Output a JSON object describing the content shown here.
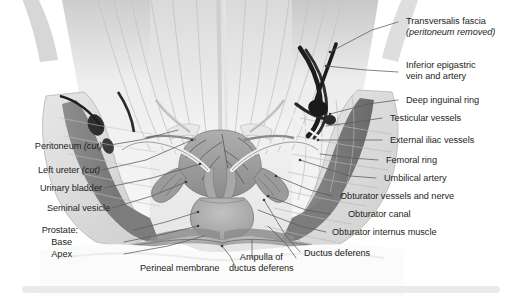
{
  "figure": {
    "style": "grayscale medical illustration"
  },
  "colors": {
    "label_text": "#231f20",
    "leader_line": "#58595b",
    "background": "#ffffff",
    "bottom_band": "#e9eaeb",
    "bone_light": "#dcdcdc",
    "muscle_mid": "#9a9a9a",
    "muscle_dark": "#6e6e6e",
    "vessel_dark": "#2b2b2b",
    "organ_mid": "#b5b5b5",
    "fascia_pale": "#efefef"
  },
  "labels": {
    "right": [
      {
        "id": "transversalis-fascia",
        "line1": "Transversalis fascia",
        "line2": "(peritoneum removed)",
        "line2_italic": true
      },
      {
        "id": "inferior-epigastric",
        "line1": "Inferior epigastric",
        "line2": "vein and artery",
        "line2_italic": false
      },
      {
        "id": "deep-inguinal-ring",
        "line1": "Deep inguinal ring",
        "line2": "",
        "line2_italic": false
      },
      {
        "id": "testicular-vessels",
        "line1": "Testicular vessels",
        "line2": "",
        "line2_italic": false
      },
      {
        "id": "external-iliac-vessels",
        "line1": "External iliac vessels",
        "line2": "",
        "line2_italic": false
      },
      {
        "id": "femoral-ring",
        "line1": "Femoral ring",
        "line2": "",
        "line2_italic": false
      },
      {
        "id": "umbilical-artery",
        "line1": "Umbilical artery",
        "line2": "",
        "line2_italic": false
      },
      {
        "id": "obturator-vessels-nerve",
        "line1": "Obturator vessels and nerve",
        "line2": "",
        "line2_italic": false
      },
      {
        "id": "obturator-canal",
        "line1": "Obturator canal",
        "line2": "",
        "line2_italic": false
      },
      {
        "id": "obturator-internus-muscle",
        "line1": "Obturator internus muscle",
        "line2": "",
        "line2_italic": false
      },
      {
        "id": "ductus-deferens",
        "line1": "Ductus deferens",
        "line2": "",
        "line2_italic": false
      }
    ],
    "left": [
      {
        "id": "peritoneum-cut",
        "text": "Peritoneum ",
        "italic_suffix": "(cut)"
      },
      {
        "id": "left-ureter-cut",
        "text": "Left ureter ",
        "italic_suffix": "(cut)"
      },
      {
        "id": "urinary-bladder",
        "text": "Urinary bladder",
        "italic_suffix": ""
      },
      {
        "id": "seminal-vesicle",
        "text": "Seminal vesicle",
        "italic_suffix": ""
      }
    ],
    "bottom": [
      {
        "id": "prostate",
        "text": "Prostate:"
      },
      {
        "id": "prostate-base",
        "text": "Base"
      },
      {
        "id": "prostate-apex",
        "text": "Apex"
      },
      {
        "id": "perineal-membrane",
        "text": "Perineal membrane"
      },
      {
        "id": "ampulla-line1",
        "text": "Ampulla of"
      },
      {
        "id": "ampulla-line2",
        "text": "ductus deferens"
      }
    ]
  }
}
